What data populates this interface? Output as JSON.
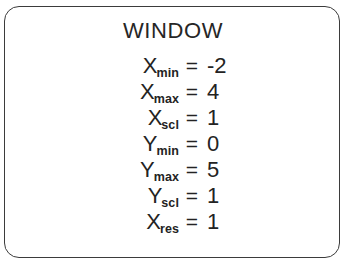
{
  "screen": {
    "title": "WINDOW",
    "border_color": "#3b3b3b",
    "text_color": "#232323",
    "background_color": "#ffffff"
  },
  "settings": [
    {
      "base": "X",
      "sub": "min",
      "eq": "=",
      "value": "-2"
    },
    {
      "base": "X",
      "sub": "max",
      "eq": "=",
      "value": "4"
    },
    {
      "base": "X",
      "sub": "scl",
      "eq": "=",
      "value": "1"
    },
    {
      "base": "Y",
      "sub": "min",
      "eq": "=",
      "value": "0"
    },
    {
      "base": "Y",
      "sub": "max",
      "eq": "=",
      "value": "5"
    },
    {
      "base": "Y",
      "sub": "scl",
      "eq": "=",
      "value": "1"
    },
    {
      "base": "X",
      "sub": "res",
      "eq": "=",
      "value": "1"
    }
  ]
}
